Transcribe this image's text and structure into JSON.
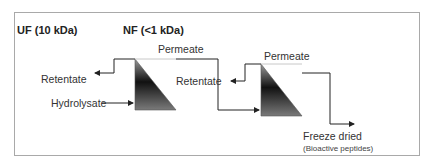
{
  "stages": [
    {
      "label": "UF (10 kDa)"
    },
    {
      "label": "NF (<1 kDa)"
    }
  ],
  "labels": {
    "retentate_1": "Retentate",
    "hydrolysate": "Hydrolysate",
    "permeate_1": "Permeate",
    "retentate_2": "Retentate",
    "permeate_2": "Permeate",
    "output": "Freeze dried",
    "output_note": "(Bioactive peptides)"
  },
  "colors": {
    "line": "#222222",
    "membrane_dark": "#1a1a1a",
    "membrane_light": "#8a8a8a",
    "border": "#a9a9a9",
    "permeate_line": "#c8c8c8"
  }
}
